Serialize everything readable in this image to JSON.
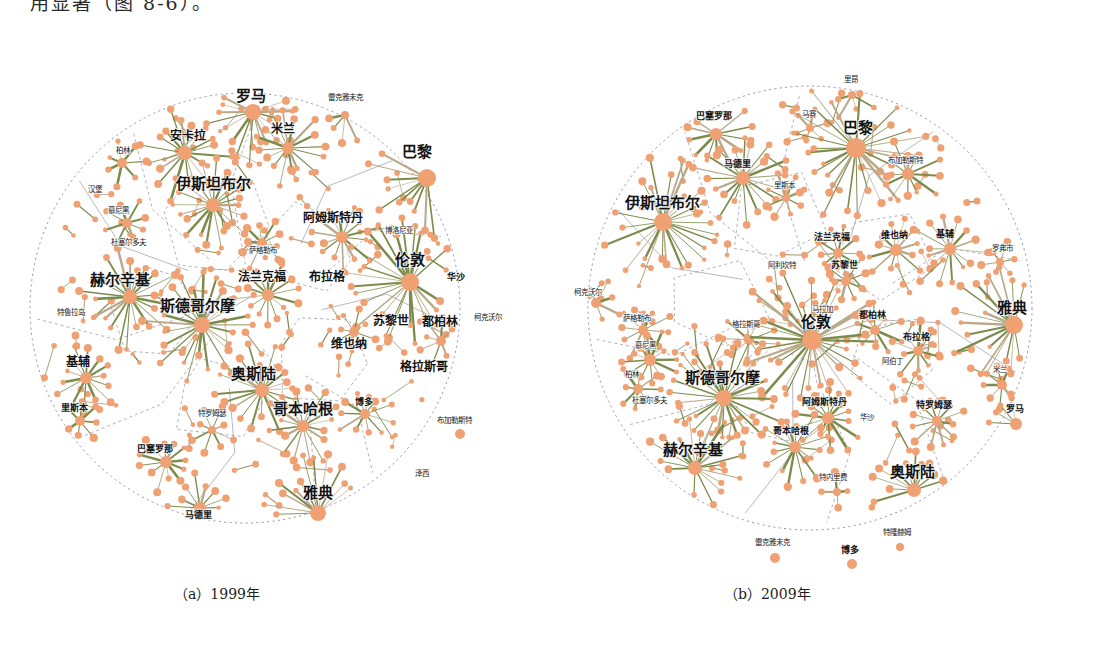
{
  "page": {
    "top_text": "用显著（图 8-6）。",
    "background": "#ffffff",
    "node_color": "#efa173",
    "edge_color": "#7d8c4c",
    "boundary_color": "#8a8ab0"
  },
  "figures": [
    {
      "id": "fig-a",
      "caption": "（a）1999年",
      "cx": 245,
      "cy": 308,
      "r": 215,
      "labels": [
        {
          "text": "罗马",
          "x": 251,
          "y": 101,
          "size": "s1"
        },
        {
          "text": "米兰",
          "x": 283,
          "y": 133,
          "size": "s2"
        },
        {
          "text": "雷克雅未克",
          "x": 345,
          "y": 100,
          "size": "s4"
        },
        {
          "text": "巴黎",
          "x": 417,
          "y": 157,
          "size": "s1"
        },
        {
          "text": "安卡拉",
          "x": 188,
          "y": 140,
          "size": "s2"
        },
        {
          "text": "柏林",
          "x": 123,
          "y": 153,
          "size": "s4"
        },
        {
          "text": "汉堡",
          "x": 95,
          "y": 192,
          "size": "s4"
        },
        {
          "text": "慕尼黑",
          "x": 118,
          "y": 213,
          "size": "s4"
        },
        {
          "text": "杜塞尔多夫",
          "x": 128,
          "y": 245,
          "size": "s4"
        },
        {
          "text": "伊斯坦布尔",
          "x": 213,
          "y": 189,
          "size": "s1"
        },
        {
          "text": "阿姆斯特丹",
          "x": 333,
          "y": 222,
          "size": "s2"
        },
        {
          "text": "博洛尼亚",
          "x": 399,
          "y": 233,
          "size": "s4"
        },
        {
          "text": "萨格勒布",
          "x": 263,
          "y": 253,
          "size": "s4"
        },
        {
          "text": "伦敦",
          "x": 410,
          "y": 265,
          "size": "s1"
        },
        {
          "text": "法兰克福",
          "x": 262,
          "y": 281,
          "size": "s2"
        },
        {
          "text": "布拉格",
          "x": 327,
          "y": 281,
          "size": "s2"
        },
        {
          "text": "华沙",
          "x": 456,
          "y": 280,
          "size": "s3"
        },
        {
          "text": "赫尔辛基",
          "x": 120,
          "y": 285,
          "size": "s1"
        },
        {
          "text": "特鲁拉岛",
          "x": 71,
          "y": 315,
          "size": "s4"
        },
        {
          "text": "斯德哥尔摩",
          "x": 197,
          "y": 311,
          "size": "s1"
        },
        {
          "text": "苏黎世",
          "x": 391,
          "y": 325,
          "size": "s2"
        },
        {
          "text": "都柏林",
          "x": 440,
          "y": 326,
          "size": "s2"
        },
        {
          "text": "柯克沃尔",
          "x": 488,
          "y": 320,
          "size": "s4"
        },
        {
          "text": "维也纳",
          "x": 349,
          "y": 348,
          "size": "s2"
        },
        {
          "text": "格拉斯哥",
          "x": 424,
          "y": 371,
          "size": "s2"
        },
        {
          "text": "基辅",
          "x": 78,
          "y": 366,
          "size": "s2"
        },
        {
          "text": "奥斯陆",
          "x": 253,
          "y": 379,
          "size": "s1"
        },
        {
          "text": "特罗姆瑟",
          "x": 212,
          "y": 416,
          "size": "s4"
        },
        {
          "text": "哥本哈根",
          "x": 303,
          "y": 414,
          "size": "s1"
        },
        {
          "text": "博多",
          "x": 364,
          "y": 405,
          "size": "s3"
        },
        {
          "text": "布加勒斯特",
          "x": 454,
          "y": 423,
          "size": "s4"
        },
        {
          "text": "里斯本",
          "x": 74,
          "y": 411,
          "size": "s3"
        },
        {
          "text": "巴塞罗那",
          "x": 155,
          "y": 452,
          "size": "s3"
        },
        {
          "text": "泽西",
          "x": 422,
          "y": 476,
          "size": "s4"
        },
        {
          "text": "马德里",
          "x": 198,
          "y": 518,
          "size": "s3"
        },
        {
          "text": "雅典",
          "x": 318,
          "y": 498,
          "size": "s1"
        }
      ],
      "hubs": [
        {
          "x": 253,
          "y": 112,
          "r": 8,
          "spokes": 22,
          "len": 46
        },
        {
          "x": 288,
          "y": 148,
          "r": 6,
          "spokes": 16,
          "len": 34
        },
        {
          "x": 345,
          "y": 115,
          "r": 4,
          "spokes": 10,
          "len": 28
        },
        {
          "x": 427,
          "y": 178,
          "r": 9,
          "spokes": 26,
          "len": 52
        },
        {
          "x": 185,
          "y": 153,
          "r": 7,
          "spokes": 18,
          "len": 44
        },
        {
          "x": 213,
          "y": 205,
          "r": 7,
          "spokes": 20,
          "len": 42
        },
        {
          "x": 122,
          "y": 163,
          "r": 5,
          "spokes": 7,
          "len": 22
        },
        {
          "x": 127,
          "y": 223,
          "r": 5,
          "spokes": 8,
          "len": 24
        },
        {
          "x": 342,
          "y": 237,
          "r": 6,
          "spokes": 14,
          "len": 32
        },
        {
          "x": 262,
          "y": 243,
          "r": 5,
          "spokes": 10,
          "len": 25
        },
        {
          "x": 410,
          "y": 282,
          "r": 9,
          "spokes": 30,
          "len": 60
        },
        {
          "x": 268,
          "y": 295,
          "r": 6,
          "spokes": 14,
          "len": 32
        },
        {
          "x": 130,
          "y": 297,
          "r": 7,
          "spokes": 22,
          "len": 46
        },
        {
          "x": 202,
          "y": 325,
          "r": 8,
          "spokes": 24,
          "len": 50
        },
        {
          "x": 86,
          "y": 378,
          "r": 6,
          "spokes": 14,
          "len": 30
        },
        {
          "x": 262,
          "y": 390,
          "r": 7,
          "spokes": 20,
          "len": 42
        },
        {
          "x": 303,
          "y": 426,
          "r": 6,
          "spokes": 16,
          "len": 34
        },
        {
          "x": 365,
          "y": 414,
          "r": 5,
          "spokes": 11,
          "len": 26
        },
        {
          "x": 460,
          "y": 434,
          "r": 5,
          "spokes": 12,
          "len": 26
        },
        {
          "x": 80,
          "y": 421,
          "r": 5,
          "spokes": 8,
          "len": 22
        },
        {
          "x": 166,
          "y": 462,
          "r": 6,
          "spokes": 12,
          "len": 28
        },
        {
          "x": 200,
          "y": 508,
          "r": 6,
          "spokes": 14,
          "len": 30
        },
        {
          "x": 318,
          "y": 513,
          "r": 8,
          "spokes": 28,
          "len": 52
        },
        {
          "x": 441,
          "y": 341,
          "r": 5,
          "spokes": 9,
          "len": 24
        },
        {
          "x": 354,
          "y": 332,
          "r": 5,
          "spokes": 8,
          "len": 22
        },
        {
          "x": 212,
          "y": 430,
          "r": 4,
          "spokes": 8,
          "len": 22
        }
      ]
    },
    {
      "id": "fig-b",
      "caption": "（b）2009年",
      "caption_x": 724,
      "cx": 810,
      "cy": 308,
      "r": 222,
      "labels": [
        {
          "text": "里昂",
          "x": 851,
          "y": 82,
          "size": "s4"
        },
        {
          "text": "巴塞罗那",
          "x": 714,
          "y": 119,
          "size": "s3"
        },
        {
          "text": "马赛",
          "x": 809,
          "y": 117,
          "size": "s4"
        },
        {
          "text": "巴黎",
          "x": 858,
          "y": 133,
          "size": "s1"
        },
        {
          "text": "马德里",
          "x": 737,
          "y": 167,
          "size": "s3"
        },
        {
          "text": "布加勒斯特",
          "x": 905,
          "y": 163,
          "size": "s4"
        },
        {
          "text": "里斯本",
          "x": 784,
          "y": 188,
          "size": "s4"
        },
        {
          "text": "伊斯坦布尔",
          "x": 662,
          "y": 208,
          "size": "s1"
        },
        {
          "text": "法兰克福",
          "x": 832,
          "y": 240,
          "size": "s3"
        },
        {
          "text": "维也纳",
          "x": 894,
          "y": 238,
          "size": "s3"
        },
        {
          "text": "基辅",
          "x": 945,
          "y": 237,
          "size": "s3"
        },
        {
          "text": "罗弗市",
          "x": 1002,
          "y": 251,
          "size": "s4"
        },
        {
          "text": "阿利坎特",
          "x": 782,
          "y": 268,
          "size": "s4"
        },
        {
          "text": "苏黎世",
          "x": 844,
          "y": 268,
          "size": "s3"
        },
        {
          "text": "柯克沃尔",
          "x": 588,
          "y": 295,
          "size": "s4"
        },
        {
          "text": "马拉加",
          "x": 822,
          "y": 312,
          "size": "s4"
        },
        {
          "text": "都柏林",
          "x": 872,
          "y": 318,
          "size": "s3"
        },
        {
          "text": "雅典",
          "x": 1012,
          "y": 313,
          "size": "s1"
        },
        {
          "text": "萨格勒布",
          "x": 637,
          "y": 321,
          "size": "s4"
        },
        {
          "text": "格拉斯哥",
          "x": 746,
          "y": 327,
          "size": "s4"
        },
        {
          "text": "伦敦",
          "x": 816,
          "y": 327,
          "size": "s1"
        },
        {
          "text": "布拉格",
          "x": 916,
          "y": 340,
          "size": "s3"
        },
        {
          "text": "慕尼黑",
          "x": 645,
          "y": 348,
          "size": "s4"
        },
        {
          "text": "柏林",
          "x": 632,
          "y": 377,
          "size": "s4"
        },
        {
          "text": "阿伯丁",
          "x": 892,
          "y": 364,
          "size": "s4"
        },
        {
          "text": "米兰",
          "x": 1000,
          "y": 372,
          "size": "s4"
        },
        {
          "text": "杜塞尔多夫",
          "x": 649,
          "y": 403,
          "size": "s4"
        },
        {
          "text": "斯德哥尔摩",
          "x": 722,
          "y": 383,
          "size": "s1"
        },
        {
          "text": "阿姆斯特丹",
          "x": 824,
          "y": 405,
          "size": "s3"
        },
        {
          "text": "特罗姆瑟",
          "x": 934,
          "y": 408,
          "size": "s3"
        },
        {
          "text": "罗马",
          "x": 1015,
          "y": 412,
          "size": "s3"
        },
        {
          "text": "华沙",
          "x": 867,
          "y": 420,
          "size": "s4"
        },
        {
          "text": "哥本哈根",
          "x": 791,
          "y": 434,
          "size": "s3"
        },
        {
          "text": "赫尔辛基",
          "x": 693,
          "y": 455,
          "size": "s1"
        },
        {
          "text": "奥斯陆",
          "x": 912,
          "y": 477,
          "size": "s1"
        },
        {
          "text": "特内里费",
          "x": 833,
          "y": 480,
          "size": "s4"
        },
        {
          "text": "特隆赫姆",
          "x": 897,
          "y": 535,
          "size": "s4"
        },
        {
          "text": "雷克雅未克",
          "x": 772,
          "y": 545,
          "size": "s4"
        },
        {
          "text": "博多",
          "x": 850,
          "y": 553,
          "size": "s3"
        }
      ],
      "hubs": [
        {
          "x": 852,
          "y": 95,
          "r": 4,
          "spokes": 8,
          "len": 24
        },
        {
          "x": 716,
          "y": 134,
          "r": 6,
          "spokes": 14,
          "len": 34
        },
        {
          "x": 810,
          "y": 128,
          "r": 4,
          "spokes": 6,
          "len": 20
        },
        {
          "x": 856,
          "y": 148,
          "r": 10,
          "spokes": 30,
          "len": 62
        },
        {
          "x": 743,
          "y": 178,
          "r": 7,
          "spokes": 20,
          "len": 44
        },
        {
          "x": 908,
          "y": 174,
          "r": 6,
          "spokes": 12,
          "len": 30
        },
        {
          "x": 786,
          "y": 198,
          "r": 4,
          "spokes": 8,
          "len": 22
        },
        {
          "x": 663,
          "y": 222,
          "r": 9,
          "spokes": 30,
          "len": 58
        },
        {
          "x": 838,
          "y": 253,
          "r": 5,
          "spokes": 10,
          "len": 26
        },
        {
          "x": 896,
          "y": 250,
          "r": 6,
          "spokes": 12,
          "len": 30
        },
        {
          "x": 950,
          "y": 249,
          "r": 6,
          "spokes": 14,
          "len": 32
        },
        {
          "x": 1000,
          "y": 262,
          "r": 4,
          "spokes": 6,
          "len": 18
        },
        {
          "x": 846,
          "y": 281,
          "r": 5,
          "spokes": 9,
          "len": 24
        },
        {
          "x": 596,
          "y": 303,
          "r": 5,
          "spokes": 8,
          "len": 22
        },
        {
          "x": 875,
          "y": 330,
          "r": 5,
          "spokes": 10,
          "len": 26
        },
        {
          "x": 1014,
          "y": 325,
          "r": 9,
          "spokes": 28,
          "len": 56
        },
        {
          "x": 643,
          "y": 330,
          "r": 5,
          "spokes": 10,
          "len": 26
        },
        {
          "x": 749,
          "y": 340,
          "r": 5,
          "spokes": 9,
          "len": 24
        },
        {
          "x": 812,
          "y": 340,
          "r": 10,
          "spokes": 34,
          "len": 64
        },
        {
          "x": 918,
          "y": 351,
          "r": 5,
          "spokes": 10,
          "len": 26
        },
        {
          "x": 650,
          "y": 360,
          "r": 6,
          "spokes": 12,
          "len": 28
        },
        {
          "x": 638,
          "y": 389,
          "r": 5,
          "spokes": 8,
          "len": 22
        },
        {
          "x": 1002,
          "y": 385,
          "r": 5,
          "spokes": 9,
          "len": 24
        },
        {
          "x": 724,
          "y": 398,
          "r": 8,
          "spokes": 26,
          "len": 52
        },
        {
          "x": 828,
          "y": 418,
          "r": 6,
          "spokes": 14,
          "len": 32
        },
        {
          "x": 937,
          "y": 421,
          "r": 5,
          "spokes": 12,
          "len": 28
        },
        {
          "x": 1016,
          "y": 424,
          "r": 6,
          "spokes": 14,
          "len": 30
        },
        {
          "x": 795,
          "y": 447,
          "r": 6,
          "spokes": 16,
          "len": 34
        },
        {
          "x": 695,
          "y": 468,
          "r": 7,
          "spokes": 22,
          "len": 46
        },
        {
          "x": 914,
          "y": 490,
          "r": 7,
          "spokes": 20,
          "len": 42
        },
        {
          "x": 837,
          "y": 492,
          "r": 4,
          "spokes": 4,
          "len": 18
        },
        {
          "x": 900,
          "y": 547,
          "r": 4,
          "spokes": 7,
          "len": 20
        },
        {
          "x": 775,
          "y": 558,
          "r": 5,
          "spokes": 10,
          "len": 24
        },
        {
          "x": 852,
          "y": 564,
          "r": 5,
          "spokes": 11,
          "len": 26
        }
      ]
    }
  ]
}
